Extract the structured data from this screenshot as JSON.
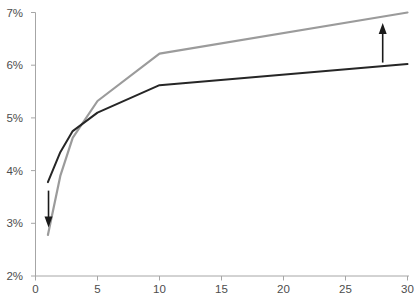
{
  "chart_data": {
    "type": "line",
    "title": "",
    "xlabel": "",
    "ylabel": "",
    "xlim": [
      0,
      30
    ],
    "ylim": [
      2,
      7
    ],
    "x_ticks": [
      0,
      5,
      10,
      15,
      20,
      25,
      30
    ],
    "x_tick_labels": [
      "0",
      "5",
      "10",
      "15",
      "20",
      "25",
      "30"
    ],
    "y_ticks": [
      2,
      3,
      4,
      5,
      6,
      7
    ],
    "y_tick_labels": [
      "2%",
      "3%",
      "4%",
      "5%",
      "6%",
      "7%"
    ],
    "grid": false,
    "legend": "none",
    "axis_color": "#a6a6a6",
    "tick_label_color": "#4d4d4d",
    "series": [
      {
        "name": "gray-line",
        "color": "#9b9b9b",
        "stroke_width": 2.2,
        "points": [
          [
            1,
            2.78
          ],
          [
            2,
            3.9
          ],
          [
            3,
            4.62
          ],
          [
            5,
            5.32
          ],
          [
            10,
            6.22
          ],
          [
            30,
            7.0
          ]
        ]
      },
      {
        "name": "black-line",
        "color": "#262626",
        "stroke_width": 2,
        "points": [
          [
            1,
            3.78
          ],
          [
            2,
            4.35
          ],
          [
            3,
            4.75
          ],
          [
            5,
            5.1
          ],
          [
            10,
            5.62
          ],
          [
            30,
            6.02
          ]
        ]
      }
    ],
    "annotations": [
      {
        "name": "down-arrow",
        "type": "arrow",
        "direction": "down",
        "x": 1.05,
        "y_from": 3.62,
        "y_to": 2.92,
        "color": "#1a1a1a"
      },
      {
        "name": "up-arrow",
        "type": "arrow",
        "direction": "up",
        "x": 28,
        "y_from": 6.05,
        "y_to": 6.8,
        "color": "#1a1a1a"
      }
    ]
  }
}
